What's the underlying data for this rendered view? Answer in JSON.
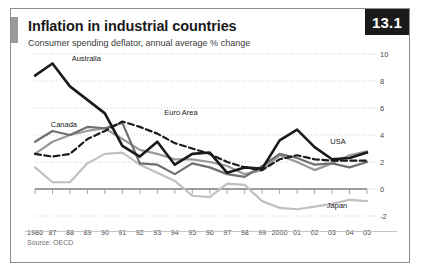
{
  "figure": {
    "number": "13.1",
    "title": "Inflation in industrial countries",
    "subtitle": "Consumer spending deflator, annual average % change",
    "source": "Source: OECD"
  },
  "chart_data": {
    "type": "line",
    "title": "Inflation in industrial countries",
    "subtitle": "Consumer spending deflator, annual average % change",
    "xlabel": "",
    "ylabel": "annual average % change",
    "ylim": [
      -2,
      10
    ],
    "yticks": [
      -2,
      0,
      2,
      4,
      6,
      8,
      10
    ],
    "ytick_labels": [
      "-2",
      "0",
      "2",
      "4",
      "6",
      "8",
      "10"
    ],
    "grid": true,
    "legend": "inline-labels",
    "x": [
      1986,
      1987,
      1988,
      1989,
      1990,
      1991,
      1992,
      1993,
      1994,
      1995,
      1996,
      1997,
      1998,
      1999,
      2000,
      2001,
      2002,
      2003,
      2004,
      2005
    ],
    "xtick_labels": [
      "1986",
      "87",
      "88",
      "89",
      "90",
      "91",
      "92",
      "93",
      "94",
      "95",
      "96",
      "97",
      "98",
      "99",
      "2000",
      "01",
      "02",
      "03",
      "04",
      "05"
    ],
    "series": [
      {
        "name": "Australia",
        "color": "#1a1a1a",
        "style": "solid",
        "width": 2.6,
        "label_x": 1988.1,
        "label_y": 9.5,
        "values": [
          8.4,
          9.3,
          7.6,
          6.6,
          5.6,
          3.2,
          2.4,
          3.5,
          1.8,
          2.6,
          2.7,
          1.2,
          1.6,
          1.5,
          3.6,
          4.4,
          3.1,
          2.2,
          2.3,
          2.7
        ]
      },
      {
        "name": "Euro Area",
        "color": "#1a1a1a",
        "style": "dashed",
        "width": 2.2,
        "label_x": 1993.4,
        "label_y": 5.5,
        "values": [
          2.6,
          2.4,
          2.6,
          3.7,
          4.3,
          5.0,
          4.6,
          4.1,
          3.4,
          3.0,
          2.6,
          2.0,
          1.6,
          1.4,
          2.2,
          2.5,
          2.2,
          2.1,
          2.1,
          2.1
        ]
      },
      {
        "name": "Canada",
        "color": "#6f6f6f",
        "style": "solid",
        "width": 2.2,
        "label_x": 1986.9,
        "label_y": 4.6,
        "values": [
          3.5,
          4.3,
          4.0,
          4.6,
          4.5,
          4.9,
          1.9,
          1.8,
          1.1,
          1.9,
          1.6,
          1.1,
          0.9,
          1.7,
          2.6,
          2.3,
          1.8,
          1.9,
          1.6,
          2.0
        ]
      },
      {
        "name": "USA",
        "color": "#9a9a9a",
        "style": "solid",
        "width": 2.2,
        "label_x": 2002.9,
        "label_y": 3.3,
        "values": [
          2.6,
          3.5,
          4.0,
          4.3,
          4.5,
          3.7,
          2.9,
          2.6,
          2.2,
          2.2,
          2.0,
          1.7,
          1.1,
          1.4,
          2.5,
          2.0,
          1.4,
          1.9,
          2.5,
          2.8
        ]
      },
      {
        "name": "Japan",
        "color": "#c0c0c0",
        "style": "solid",
        "width": 2.2,
        "label_x": 2002.7,
        "label_y": -1.4,
        "values": [
          1.6,
          0.5,
          0.5,
          1.9,
          2.6,
          2.7,
          1.8,
          1.2,
          0.6,
          -0.5,
          -0.6,
          0.4,
          0.3,
          -0.9,
          -1.4,
          -1.5,
          -1.3,
          -1.1,
          -0.8,
          -0.9
        ]
      }
    ]
  }
}
